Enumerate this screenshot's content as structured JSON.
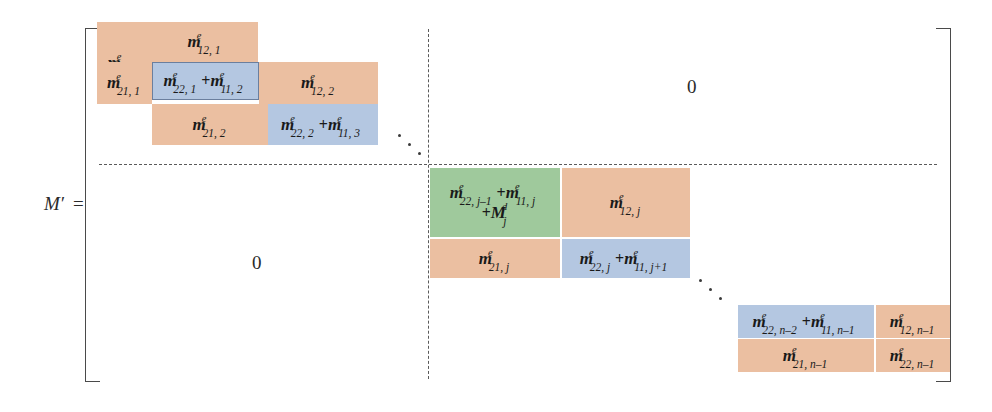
{
  "figure": {
    "label_variable": "M",
    "label_prime": "′",
    "label_equals": "=",
    "colors": {
      "orange": "#ebbfa1",
      "blue": "#b4c7e1",
      "green": "#9fc99c",
      "bracket": "#4a4a4a",
      "dashed_line": "#5a5a5a",
      "text": "#1a1a1a"
    }
  },
  "zero_blocks": [
    {
      "name": "top-right-zero",
      "text": "0"
    },
    {
      "name": "bottom-left-zero",
      "text": "0"
    }
  ],
  "blocks": {
    "top_left": {
      "cells": [
        {
          "id": "m11-1",
          "base": "m",
          "sup": "e",
          "sub": "11, 1",
          "color": "orange"
        },
        {
          "id": "m12-1",
          "base": "m",
          "sup": "e",
          "sub": "12, 1",
          "color": "orange"
        },
        {
          "id": "m21-1",
          "base": "m",
          "sup": "e",
          "sub": "21, 1",
          "color": "orange"
        },
        {
          "id": "m22-1-plus-m11-2",
          "terms": [
            {
              "base": "m",
              "sup": "e",
              "sub": "22, 1"
            },
            {
              "op": "+"
            },
            {
              "base": "m",
              "sup": "e",
              "sub": "11, 2"
            }
          ],
          "color": "blue-outline"
        },
        {
          "id": "m12-2",
          "base": "m",
          "sup": "e",
          "sub": "12, 2",
          "color": "orange"
        },
        {
          "id": "m21-2",
          "base": "m",
          "sup": "e",
          "sub": "21, 2",
          "color": "orange"
        },
        {
          "id": "m22-2-plus-m11-3",
          "terms": [
            {
              "base": "m",
              "sup": "e",
              "sub": "22, 2"
            },
            {
              "op": "+"
            },
            {
              "base": "m",
              "sup": "e",
              "sub": "11, 3"
            }
          ],
          "color": "blue"
        }
      ]
    },
    "middle": {
      "cells": [
        {
          "id": "m22-jm1-plus-m11-j-plus-Mjd",
          "line1_terms": [
            {
              "base": "m",
              "sup": "e",
              "sub": "22, j–1"
            },
            {
              "op": "+"
            },
            {
              "base": "m",
              "sup": "e",
              "sub": "11, j"
            }
          ],
          "line2_terms": [
            {
              "op": "+"
            },
            {
              "base": "M",
              "sup": "d",
              "sub": "j"
            }
          ],
          "color": "green"
        },
        {
          "id": "m12-j",
          "base": "m",
          "sup": "e",
          "sub": "12, j",
          "color": "orange"
        },
        {
          "id": "m21-j",
          "base": "m",
          "sup": "e",
          "sub": "21, j",
          "color": "orange"
        },
        {
          "id": "m22-j-plus-m11-jp1",
          "terms": [
            {
              "base": "m",
              "sup": "e",
              "sub": "22, j"
            },
            {
              "op": "+"
            },
            {
              "base": "m",
              "sup": "e",
              "sub": "11, j+1"
            }
          ],
          "color": "blue"
        }
      ]
    },
    "bottom_right": {
      "cells": [
        {
          "id": "m22-nm2-plus-m11-nm1",
          "terms": [
            {
              "base": "m",
              "sup": "e",
              "sub": "22, n–2"
            },
            {
              "op": "+"
            },
            {
              "base": "m",
              "sup": "e",
              "sub": "11, n–1"
            }
          ],
          "color": "blue"
        },
        {
          "id": "m12-nm1",
          "base": "m",
          "sup": "e",
          "sub": "12, n–1",
          "color": "orange"
        },
        {
          "id": "m21-nm1",
          "base": "m",
          "sup": "e",
          "sub": "21, n–1",
          "color": "orange"
        },
        {
          "id": "m22-nm1",
          "base": "m",
          "sup": "e",
          "sub": "22, n–1",
          "color": "orange"
        }
      ]
    }
  }
}
